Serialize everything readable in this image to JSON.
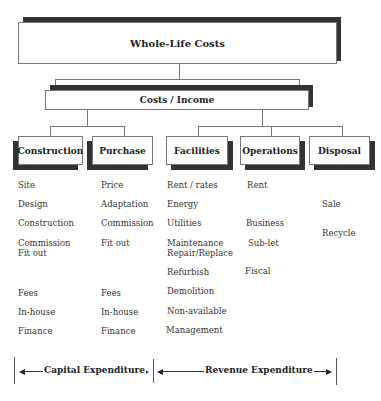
{
  "root": {
    "label": "Whole-Life Costs"
  },
  "level2": {
    "label": "Costs / Income"
  },
  "categories": [
    {
      "label": "Construction",
      "items": [
        "Site",
        "Design",
        "Construction",
        "Commission",
        "Fit out",
        "Fees",
        "In-house",
        "Finance"
      ]
    },
    {
      "label": "Purchase",
      "items": [
        "Price",
        "Adaptation",
        "Commission",
        "Fit out",
        "Fees",
        "In-house",
        "Finance"
      ]
    },
    {
      "label": "Facilities",
      "items": [
        "Rent / rates",
        "Energy",
        "Utilities",
        "Maintenance",
        "Repair/Replace",
        "Refurbish",
        "Demolition",
        "Non-available",
        "Management"
      ]
    },
    {
      "label": "Operations",
      "items": [
        "Rent",
        "Business",
        "Sub-let",
        "Fiscal"
      ]
    },
    {
      "label": "Disposal",
      "items": [
        "Sale",
        "Recycle"
      ]
    }
  ],
  "expenditure": {
    "capital": "Capital Expenditure",
    "revenue": "Revenue Expenditure"
  }
}
